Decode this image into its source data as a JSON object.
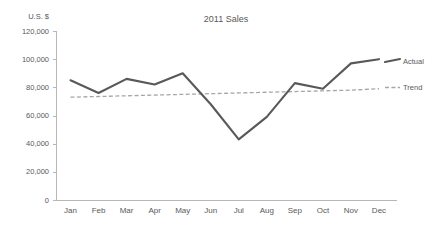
{
  "chart_data": {
    "type": "line",
    "title": "2011 Sales",
    "xlabel": "",
    "ylabel": "U.S. $",
    "ylim": [
      0,
      120000
    ],
    "ytick_step": 20000,
    "grid": false,
    "legend_position": "right",
    "categories": [
      "Jan",
      "Feb",
      "Mar",
      "Apr",
      "May",
      "Jun",
      "Jul",
      "Aug",
      "Sep",
      "Oct",
      "Nov",
      "Dec"
    ],
    "ytick_labels": [
      "0",
      "20,000",
      "40,000",
      "60,000",
      "80,000",
      "100,000",
      "120,000"
    ],
    "ytick_values": [
      0,
      20000,
      40000,
      60000,
      80000,
      100000,
      120000
    ],
    "series": [
      {
        "name": "Actual",
        "style": "solid",
        "color": "#595959",
        "values": [
          85000,
          76000,
          86000,
          82000,
          90000,
          68000,
          43000,
          59000,
          83000,
          79000,
          97000,
          100000
        ]
      },
      {
        "name": "Trend",
        "style": "dashed",
        "color": "#a6a6a6",
        "values": [
          73000,
          73500,
          74000,
          74500,
          75000,
          75500,
          76000,
          76500,
          77000,
          77500,
          78000,
          79000
        ]
      }
    ]
  },
  "legend": {
    "actual_label": "Actual",
    "trend_label": "Trend"
  }
}
